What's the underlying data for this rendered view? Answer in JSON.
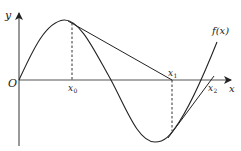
{
  "figure": {
    "width": 241,
    "height": 151,
    "background": "#ffffff",
    "stroke_color": "#222222",
    "axis_color": "#444444"
  },
  "axes": {
    "origin": {
      "x": 19,
      "y": 80
    },
    "x_axis": {
      "x_start": 19,
      "x_end": 232,
      "y": 80,
      "label": "x"
    },
    "y_axis": {
      "x": 19,
      "y_top": 12,
      "y_bottom": 146,
      "label": "y"
    },
    "origin_label": "O"
  },
  "curve": {
    "name": "f(x)",
    "label": "f(x)",
    "description": "sinusoid-like curve rising from origin to a maximum, descending through the x-axis to a minimum, then rising again"
  },
  "points": {
    "x0": {
      "label": "x",
      "subscript": "0",
      "px": 72,
      "py": 23
    },
    "x1": {
      "label": "x",
      "subscript": "1",
      "px": 172,
      "py": 80
    },
    "tangent_point_2": {
      "px": 173,
      "py": 131
    },
    "x2": {
      "label": "x",
      "subscript": "2",
      "px": 213,
      "py": 80
    }
  },
  "tangent_lines": [
    {
      "name": "tangent-at-x0",
      "from": [
        72,
        23
      ],
      "to": [
        172,
        80
      ]
    },
    {
      "name": "tangent-at-x1",
      "from": [
        173,
        131
      ],
      "to": [
        213,
        77
      ]
    }
  ],
  "dashed_lines": [
    {
      "name": "dashed-x0",
      "x": 72,
      "y_from": 23,
      "y_to": 80
    },
    {
      "name": "dashed-x1",
      "x": 172,
      "y_from": 80,
      "y_to": 131
    }
  ],
  "labels": {
    "y_axis": "y",
    "x_axis": "x",
    "origin": "O",
    "fx": "f(x)",
    "x0_main": "x",
    "x0_sub": "0",
    "x1_main": "x",
    "x1_sub": "1",
    "x2_main": "x",
    "x2_sub": "2"
  }
}
